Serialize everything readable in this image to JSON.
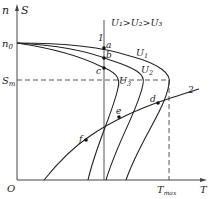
{
  "axes": {
    "y_label_n": "n",
    "y_label_s": "S",
    "x_label": "T",
    "origin": "O",
    "n0_label": "n",
    "n0_sub": "0",
    "sm_label": "S",
    "sm_sub": "m",
    "tmax_label": "T",
    "tmax_sub": "max"
  },
  "legend": {
    "relation": "U₁>U₂>U₃"
  },
  "curves": {
    "u1": {
      "label": "U",
      "sub": "1"
    },
    "u2": {
      "label": "U",
      "sub": "2"
    },
    "u3": {
      "label": "U",
      "sub": "3"
    },
    "line1": "1",
    "line2": "2"
  },
  "points": {
    "a": "a",
    "b": "b",
    "c": "c",
    "d": "d",
    "e": "e",
    "f": "f"
  },
  "colors": {
    "line": "#222222",
    "axis": "#555555"
  }
}
